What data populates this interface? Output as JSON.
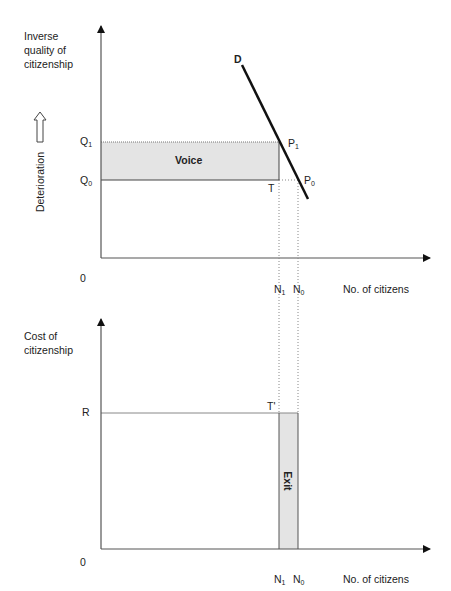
{
  "top_panel": {
    "y_axis_title": "Inverse\nquality of\ncitizenship",
    "side_label": "Deterioration",
    "side_icon": "hollow-up-arrow-icon",
    "origin_label": "0",
    "x_axis_title": "No. of citizens",
    "q1_label": "Q",
    "q1_sub": "1",
    "q0_label": "Q",
    "q0_sub": "0",
    "n1_label": "N",
    "n1_sub": "1",
    "n0_label": "N",
    "n0_sub": "0",
    "curve_label": "D",
    "p1_label": "P",
    "p1_sub": "1",
    "p0_label": "P",
    "p0_sub": "0",
    "t_label": "T",
    "region_label": "Voice"
  },
  "bottom_panel": {
    "y_axis_title": "Cost of\ncitizenship",
    "origin_label": "0",
    "x_axis_title": "No. of citizens",
    "r_label": "R",
    "t_prime_label": "T'",
    "n1_label": "N",
    "n1_sub": "1",
    "n0_label": "N",
    "n0_sub": "0",
    "region_label": "Exit"
  },
  "colors": {
    "axis": "#555555",
    "curve": "#111111",
    "shade": "#e4e4e4",
    "guide": "#888888"
  }
}
